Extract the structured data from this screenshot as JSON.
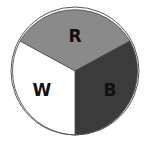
{
  "spinner": {
    "center": [
      75,
      71
    ],
    "radius": 64,
    "segments": [
      {
        "label": "R",
        "color": "#8a8a8a",
        "path": "M75,71 L20,41 A64,64 0 0,1 130,41 Z",
        "label_pos": [
          75,
          42
        ]
      },
      {
        "label": "B",
        "color": "#3b3b3b",
        "path": "M75,71 L130,41 A64,64 0 0,1 75,135 Z",
        "label_pos": [
          110,
          96
        ]
      },
      {
        "label": "W",
        "color": "#ffffff",
        "path": "M75,71 L75,135 A64,64 0 0,1 20,41 Z",
        "label_pos": [
          42,
          96
        ]
      }
    ],
    "outline_color": "#444444"
  }
}
